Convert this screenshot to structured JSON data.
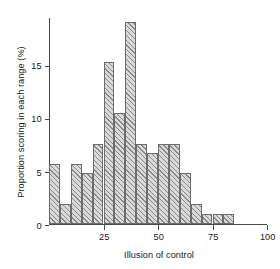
{
  "chart_data": {
    "type": "bar",
    "title": "",
    "subtitle": "",
    "xlabel": "Illusion of control",
    "ylabel": "Proportion scoring in each range (%)",
    "grid": false,
    "legend": false,
    "legend_position": "none",
    "bin_width": 5,
    "xlim": [
      0,
      100
    ],
    "ylim": [
      0,
      19.5
    ],
    "xticks": [
      25,
      50,
      75,
      100
    ],
    "xtick_labels": [
      "25",
      "50",
      "75",
      "100"
    ],
    "yticks": [
      0,
      5,
      10,
      15
    ],
    "ytick_labels": [
      "0",
      "5",
      "10",
      "15"
    ],
    "categories": [
      "0-5",
      "5-10",
      "10-15",
      "15-20",
      "20-25",
      "25-30",
      "30-35",
      "35-40",
      "40-45",
      "45-50",
      "50-55",
      "55-60",
      "60-65",
      "65-70",
      "70-75",
      "75-80",
      "80-85",
      "85-90",
      "90-95",
      "95-100"
    ],
    "bin_edges": [
      0,
      5,
      10,
      15,
      20,
      25,
      30,
      35,
      40,
      45,
      50,
      55,
      60,
      65,
      70,
      75,
      80,
      85,
      90,
      95,
      100
    ],
    "values": [
      5.7,
      1.9,
      5.7,
      4.8,
      7.6,
      15.3,
      10.5,
      19.1,
      7.6,
      6.7,
      7.6,
      7.6,
      4.8,
      1.9,
      1.0,
      1.0,
      1.0,
      0.0,
      0.0,
      0.0
    ],
    "series": [
      {
        "name": "Proportion scoring in each range (%)",
        "values": [
          5.7,
          1.9,
          5.7,
          4.8,
          7.6,
          15.3,
          10.5,
          19.1,
          7.6,
          6.7,
          7.6,
          7.6,
          4.8,
          1.9,
          1.0,
          1.0,
          1.0,
          0.0,
          0.0,
          0.0
        ]
      }
    ],
    "colors": {
      "bar_fill": "#d9d9d9",
      "bar_hatch": "#8a8a8a",
      "bar_edge": "#6d6d6d",
      "axis": "#4a4a4a",
      "text": "#1a1a1a",
      "background": "#ffffff"
    }
  }
}
